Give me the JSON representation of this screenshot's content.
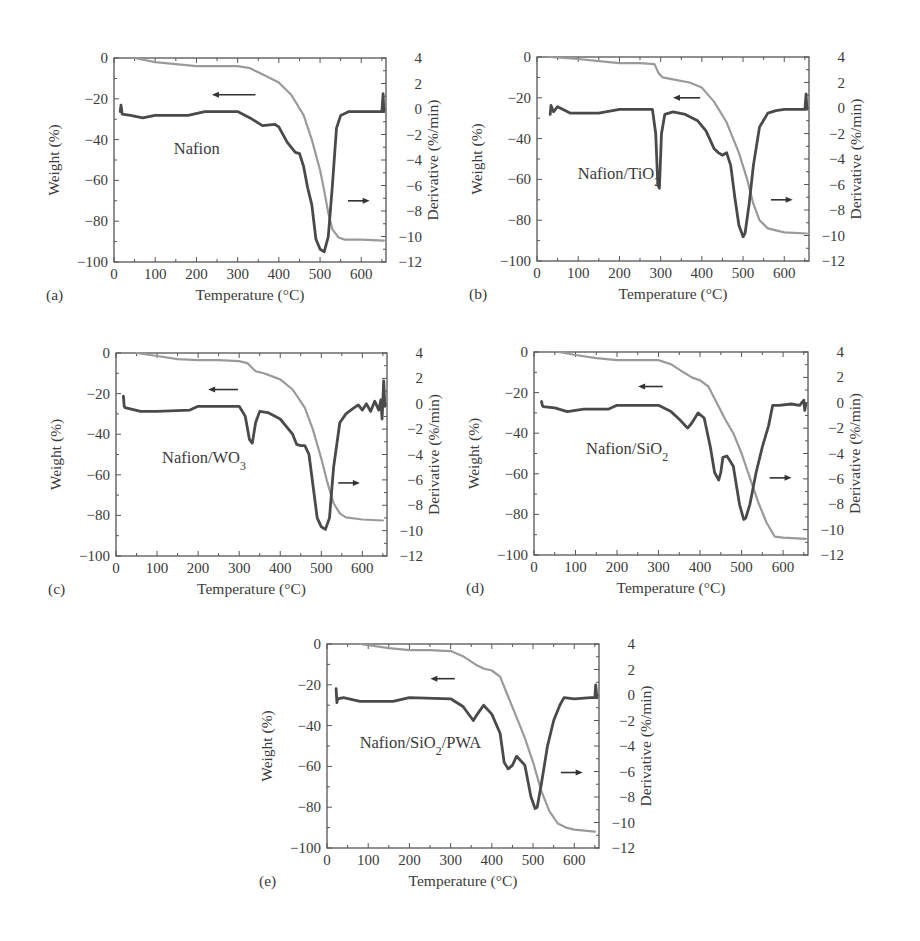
{
  "figure": {
    "x_axis_label": "Temperature (°C)",
    "left_axis_label": "Weight (%)",
    "right_axis_label": "Derivative (%/min)",
    "colors": {
      "weight_curve": "#9a9a9a",
      "derivative_curve": "#4a4a4a",
      "axes": "#555555",
      "text": "#3a3a3a"
    }
  },
  "chart_data": [
    {
      "panel": "(a)",
      "type": "line",
      "title": "Nafion",
      "xlabel": "Temperature (°C)",
      "ylabel": "Weight (%)",
      "y2label": "Derivative (%/min)",
      "xlim": [
        0,
        660
      ],
      "ylim": [
        -100,
        0
      ],
      "y2lim": [
        -12,
        4
      ],
      "xticks": [
        0,
        100,
        200,
        300,
        400,
        500,
        600
      ],
      "yticks": [
        0,
        -20,
        -40,
        -60,
        -80,
        -100
      ],
      "y2ticks": [
        4,
        2,
        0,
        -2,
        -4,
        -6,
        -8,
        -10,
        -12
      ],
      "grid": false,
      "annotations": [
        "← arrow points to Weight curve (left axis)",
        "→ arrow points to Derivative curve (right axis)"
      ],
      "series": [
        {
          "name": "Weight (%)",
          "axis": "left",
          "x": [
            50,
            100,
            150,
            200,
            250,
            300,
            330,
            360,
            400,
            430,
            460,
            480,
            500,
            510,
            520,
            530,
            545,
            560,
            600,
            655
          ],
          "y": [
            0,
            -2,
            -3,
            -4,
            -4,
            -4,
            -5,
            -8,
            -12,
            -18,
            -28,
            -40,
            -55,
            -65,
            -76,
            -84,
            -88,
            -89,
            -89,
            -89.5
          ]
        },
        {
          "name": "Derivative (%/min)",
          "axis": "right",
          "x": [
            15,
            17,
            20,
            40,
            70,
            100,
            150,
            180,
            220,
            300,
            330,
            360,
            390,
            400,
            420,
            440,
            450,
            460,
            470,
            480,
            490,
            500,
            510,
            520,
            530,
            540,
            550,
            570,
            600,
            650,
            653,
            655
          ],
          "y": [
            -0.2,
            0.3,
            -0.4,
            -0.5,
            -0.7,
            -0.5,
            -0.5,
            -0.5,
            -0.2,
            -0.2,
            -0.7,
            -1.3,
            -1.2,
            -1.4,
            -2.6,
            -3.4,
            -3.5,
            -4.5,
            -6.2,
            -7.5,
            -10.2,
            -11.0,
            -11.2,
            -10.0,
            -6.0,
            -1.5,
            -0.5,
            -0.2,
            -0.2,
            -0.2,
            1.2,
            -0.2
          ]
        }
      ]
    },
    {
      "panel": "(b)",
      "type": "line",
      "title": "Nafion/TiO2",
      "xlabel": "Temperature (°C)",
      "ylabel": "Weight (%)",
      "y2label": "Derivative (%/min)",
      "xlim": [
        0,
        660
      ],
      "ylim": [
        -100,
        0
      ],
      "y2lim": [
        -12,
        4
      ],
      "xticks": [
        0,
        100,
        200,
        300,
        400,
        500,
        600
      ],
      "yticks": [
        0,
        -20,
        -40,
        -60,
        -80,
        -100
      ],
      "y2ticks": [
        4,
        2,
        0,
        -2,
        -4,
        -6,
        -8,
        -10,
        -12
      ],
      "grid": false,
      "annotations": [
        "← arrow points to Weight curve (left axis)",
        "→ arrow points to Derivative curve (right axis)"
      ],
      "series": [
        {
          "name": "Weight (%)",
          "axis": "left",
          "x": [
            30,
            100,
            150,
            200,
            250,
            285,
            295,
            305,
            330,
            370,
            400,
            430,
            460,
            490,
            510,
            525,
            540,
            560,
            600,
            655
          ],
          "y": [
            0,
            -1,
            -2,
            -3,
            -3,
            -3.5,
            -8,
            -10,
            -11,
            -12.5,
            -15,
            -22,
            -32,
            -47,
            -60,
            -72,
            -80,
            -84,
            -86,
            -86.5
          ]
        },
        {
          "name": "Derivative (%/min)",
          "axis": "right",
          "x": [
            32,
            34,
            40,
            50,
            80,
            150,
            200,
            280,
            288,
            293,
            297,
            302,
            310,
            330,
            360,
            390,
            410,
            430,
            440,
            450,
            460,
            470,
            480,
            490,
            500,
            505,
            515,
            525,
            540,
            560,
            580,
            600,
            650,
            653,
            655
          ],
          "y": [
            -0.5,
            0.2,
            -0.3,
            0.1,
            -0.4,
            -0.4,
            -0.1,
            -0.1,
            -2.0,
            -6.0,
            -6.3,
            -2.0,
            -0.5,
            -0.3,
            -0.5,
            -1.0,
            -1.8,
            -3.2,
            -3.5,
            -3.7,
            -3.5,
            -4.5,
            -7.0,
            -9.2,
            -10.1,
            -9.8,
            -7.5,
            -4.5,
            -1.5,
            -0.4,
            -0.2,
            -0.1,
            -0.1,
            1.1,
            -0.1
          ]
        }
      ]
    },
    {
      "panel": "(c)",
      "type": "line",
      "title": "Nafion/WO3",
      "xlabel": "Temperature (°C)",
      "ylabel": "Weight (%)",
      "y2label": "Derivative (%/min)",
      "xlim": [
        0,
        660
      ],
      "ylim": [
        -100,
        0
      ],
      "y2lim": [
        -12,
        4
      ],
      "xticks": [
        0,
        100,
        200,
        300,
        400,
        500,
        600
      ],
      "yticks": [
        0,
        -20,
        -40,
        -60,
        -80,
        -100
      ],
      "y2ticks": [
        4,
        2,
        0,
        -2,
        -4,
        -6,
        -8,
        -10,
        -12
      ],
      "grid": false,
      "annotations": [
        "← arrow points to Weight curve (left axis)",
        "→ arrow points to Derivative curve (right axis)"
      ],
      "series": [
        {
          "name": "Weight (%)",
          "axis": "left",
          "x": [
            50,
            100,
            150,
            200,
            250,
            300,
            320,
            340,
            360,
            400,
            430,
            460,
            480,
            500,
            515,
            530,
            545,
            560,
            600,
            650
          ],
          "y": [
            0,
            -1.5,
            -3,
            -3.5,
            -3.5,
            -4,
            -5,
            -9,
            -10,
            -13,
            -18,
            -27,
            -38,
            -52,
            -64,
            -74,
            -79,
            -81,
            -82,
            -82.5
          ]
        },
        {
          "name": "Derivative (%/min)",
          "axis": "right",
          "x": [
            18,
            20,
            22,
            60,
            100,
            180,
            200,
            300,
            315,
            325,
            332,
            340,
            350,
            370,
            400,
            430,
            440,
            450,
            460,
            470,
            480,
            490,
            500,
            510,
            520,
            530,
            545,
            560,
            580,
            590,
            600,
            610,
            620,
            630,
            640,
            645,
            648,
            652,
            655
          ],
          "y": [
            0.6,
            -0.2,
            -0.3,
            -0.6,
            -0.6,
            -0.5,
            -0.2,
            -0.2,
            -1.0,
            -2.8,
            -3.1,
            -1.5,
            -0.6,
            -0.7,
            -1.2,
            -2.4,
            -3.2,
            -3.3,
            -3.3,
            -4.0,
            -6.5,
            -9.0,
            -9.7,
            -9.9,
            -9.0,
            -5.0,
            -1.5,
            -0.8,
            -0.3,
            -0.1,
            -0.5,
            0.0,
            -0.6,
            0.2,
            -0.5,
            0.3,
            -1.2,
            1.8,
            -0.2
          ]
        }
      ]
    },
    {
      "panel": "(d)",
      "type": "line",
      "title": "Nafion/SiO2",
      "xlabel": "Temperature (°C)",
      "ylabel": "Weight (%)",
      "y2label": "Derivative (%/min)",
      "xlim": [
        0,
        660
      ],
      "ylim": [
        -100,
        0
      ],
      "y2lim": [
        -12,
        4
      ],
      "xticks": [
        0,
        100,
        200,
        300,
        400,
        500,
        600
      ],
      "yticks": [
        0,
        -20,
        -40,
        -60,
        -80,
        -100
      ],
      "y2ticks": [
        4,
        2,
        0,
        -2,
        -4,
        -6,
        -8,
        -10,
        -12
      ],
      "grid": false,
      "annotations": [
        "← arrow points to Weight curve (left axis)",
        "→ arrow points to Derivative curve (right axis)"
      ],
      "series": [
        {
          "name": "Weight (%)",
          "axis": "left",
          "x": [
            60,
            100,
            150,
            200,
            250,
            300,
            330,
            360,
            380,
            400,
            420,
            440,
            460,
            480,
            500,
            520,
            540,
            560,
            580,
            600,
            655
          ],
          "y": [
            0,
            -1.5,
            -3,
            -4,
            -4,
            -4,
            -6,
            -10,
            -12.5,
            -14,
            -17,
            -25,
            -33,
            -40,
            -50,
            -62,
            -74,
            -84,
            -91,
            -91.5,
            -92
          ]
        },
        {
          "name": "Derivative (%/min)",
          "axis": "right",
          "x": [
            18,
            20,
            22,
            50,
            80,
            120,
            180,
            200,
            300,
            330,
            350,
            370,
            380,
            395,
            410,
            425,
            435,
            445,
            450,
            455,
            465,
            480,
            495,
            505,
            510,
            520,
            535,
            550,
            565,
            575,
            590,
            620,
            640,
            650,
            652,
            655
          ],
          "y": [
            0.1,
            -0.2,
            -0.3,
            -0.4,
            -0.7,
            -0.5,
            -0.5,
            -0.2,
            -0.2,
            -0.7,
            -1.3,
            -2.0,
            -1.6,
            -0.8,
            -1.2,
            -3.5,
            -5.5,
            -6.1,
            -5.5,
            -4.3,
            -4.2,
            -5.0,
            -8.0,
            -9.2,
            -9.1,
            -8.0,
            -5.5,
            -3.5,
            -1.8,
            -0.2,
            -0.2,
            -0.1,
            -0.2,
            0.2,
            -0.6,
            -0.1
          ]
        }
      ]
    },
    {
      "panel": "(e)",
      "type": "line",
      "title": "Nafion/SiO2/PWA",
      "xlabel": "Temperature (°C)",
      "ylabel": "Weight (%)",
      "y2label": "Derivative (%/min)",
      "xlim": [
        0,
        660
      ],
      "ylim": [
        -100,
        0
      ],
      "y2lim": [
        -12,
        4
      ],
      "xticks": [
        0,
        100,
        200,
        300,
        400,
        500,
        600
      ],
      "yticks": [
        0,
        -20,
        -40,
        -60,
        -80,
        -100
      ],
      "y2ticks": [
        4,
        2,
        0,
        -2,
        -4,
        -6,
        -8,
        -10,
        -12
      ],
      "grid": false,
      "annotations": [
        "← arrow points to Weight curve (left axis)",
        "→ arrow points to Derivative curve (right axis)"
      ],
      "series": [
        {
          "name": "Weight (%)",
          "axis": "left",
          "x": [
            80,
            150,
            200,
            250,
            300,
            330,
            360,
            380,
            400,
            420,
            440,
            460,
            480,
            500,
            520,
            540,
            560,
            580,
            600,
            650
          ],
          "y": [
            0,
            -2,
            -3,
            -3,
            -3.5,
            -6,
            -10,
            -12,
            -13,
            -16,
            -26,
            -36,
            -46,
            -58,
            -72,
            -82,
            -88,
            -90,
            -91,
            -92
          ]
        },
        {
          "name": "Derivative (%/min)",
          "axis": "right",
          "x": [
            22,
            24,
            26,
            40,
            80,
            120,
            160,
            200,
            300,
            330,
            355,
            365,
            380,
            400,
            420,
            430,
            440,
            450,
            460,
            480,
            495,
            505,
            510,
            520,
            535,
            550,
            565,
            575,
            600,
            640,
            650,
            652,
            655
          ],
          "y": [
            0.5,
            -0.6,
            -0.3,
            -0.2,
            -0.5,
            -0.5,
            -0.5,
            -0.2,
            -0.3,
            -0.9,
            -2.0,
            -1.5,
            -0.8,
            -1.5,
            -3.0,
            -5.3,
            -5.8,
            -5.5,
            -4.8,
            -5.5,
            -8.0,
            -8.9,
            -8.8,
            -7.0,
            -4.0,
            -2.0,
            -0.8,
            -0.2,
            -0.3,
            -0.2,
            -0.2,
            0.8,
            -0.2
          ]
        }
      ]
    }
  ]
}
